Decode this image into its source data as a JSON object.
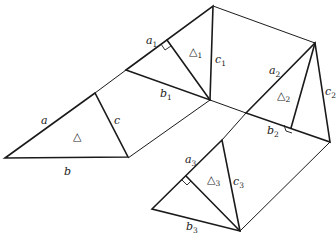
{
  "figure": {
    "ink_color": "#1a1a1a",
    "background_color": "#ffffff"
  },
  "main_triangle": {
    "side_labels": {
      "a": "a",
      "b": "b",
      "c": "c"
    },
    "area_label": "△"
  },
  "triangle_1": {
    "side_labels": {
      "a": "a",
      "b": "b",
      "c": "c"
    },
    "subscript": "1",
    "area_label": "△",
    "right_angle_marker": true
  },
  "triangle_2": {
    "side_labels": {
      "a": "a",
      "b": "b",
      "c": "c"
    },
    "subscript": "2",
    "area_label": "△",
    "right_angle_marker": true
  },
  "triangle_3": {
    "side_labels": {
      "a": "a",
      "b": "b",
      "c": "c"
    },
    "subscript": "3",
    "area_label": "△",
    "right_angle_marker": true
  }
}
